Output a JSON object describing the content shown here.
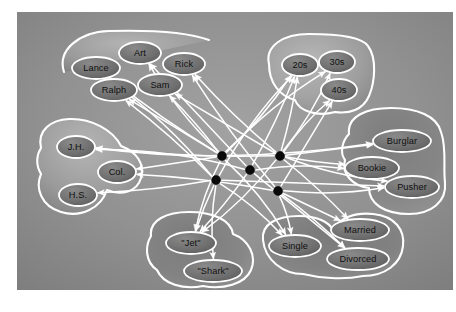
{
  "figure": {
    "type": "network-diagram",
    "background_color": "#8e8e8e",
    "outline_color": "#ffffff",
    "node_fill_color": "#6e6e6e",
    "hidden_unit_color": "#0a0a0a",
    "label_color": "#101010",
    "canvas": {
      "x": 17,
      "y": 12,
      "width": 436,
      "height": 278
    }
  },
  "groups": [
    {
      "id": "names",
      "name": "name-group",
      "nodes": [
        {
          "id": "art",
          "label": "Art",
          "cx": 123,
          "cy": 41,
          "rx": 21,
          "ry": 11
        },
        {
          "id": "lance",
          "label": "Lance",
          "cx": 79,
          "cy": 56,
          "rx": 24,
          "ry": 11
        },
        {
          "id": "rick",
          "label": "Rick",
          "cx": 167,
          "cy": 52,
          "rx": 21,
          "ry": 11
        },
        {
          "id": "sam",
          "label": "Sam",
          "cx": 143,
          "cy": 73,
          "rx": 22,
          "ry": 11
        },
        {
          "id": "ralph",
          "label": "Ralph",
          "cx": 97,
          "cy": 78,
          "rx": 23,
          "ry": 11
        }
      ]
    },
    {
      "id": "age",
      "name": "age-group",
      "nodes": [
        {
          "id": "20s",
          "label": "20s",
          "cx": 283,
          "cy": 53,
          "rx": 18,
          "ry": 11
        },
        {
          "id": "30s",
          "label": "30s",
          "cx": 320,
          "cy": 50,
          "rx": 18,
          "ry": 11
        },
        {
          "id": "40s",
          "label": "40s",
          "cx": 322,
          "cy": 78,
          "rx": 18,
          "ry": 11
        }
      ]
    },
    {
      "id": "education",
      "name": "education-group",
      "nodes": [
        {
          "id": "jh",
          "label": "J.H.",
          "cx": 59,
          "cy": 135,
          "rx": 19,
          "ry": 11
        },
        {
          "id": "col",
          "label": "Col.",
          "cx": 100,
          "cy": 160,
          "rx": 19,
          "ry": 11
        },
        {
          "id": "hs",
          "label": "H.S.",
          "cx": 61,
          "cy": 183,
          "rx": 19,
          "ry": 11
        }
      ]
    },
    {
      "id": "occupation",
      "name": "occupation-group",
      "nodes": [
        {
          "id": "burglar",
          "label": "Burglar",
          "cx": 385,
          "cy": 129,
          "rx": 29,
          "ry": 11
        },
        {
          "id": "bookie",
          "label": "Bookie",
          "cx": 355,
          "cy": 156,
          "rx": 27,
          "ry": 11
        },
        {
          "id": "pusher",
          "label": "Pusher",
          "cx": 395,
          "cy": 175,
          "rx": 27,
          "ry": 11
        }
      ]
    },
    {
      "id": "gang",
      "name": "gang-group",
      "nodes": [
        {
          "id": "jet",
          "label": "\"Jet\"",
          "cx": 174,
          "cy": 231,
          "rx": 25,
          "ry": 11
        },
        {
          "id": "shark",
          "label": "\"Shark\"",
          "cx": 196,
          "cy": 259,
          "rx": 29,
          "ry": 11
        }
      ]
    },
    {
      "id": "marital",
      "name": "marital-status-group",
      "nodes": [
        {
          "id": "single",
          "label": "Single",
          "cx": 278,
          "cy": 234,
          "rx": 26,
          "ry": 11
        },
        {
          "id": "married",
          "label": "Married",
          "cx": 343,
          "cy": 218,
          "rx": 29,
          "ry": 11
        },
        {
          "id": "divorced",
          "label": "Divorced",
          "cx": 341,
          "cy": 247,
          "rx": 31,
          "ry": 11
        }
      ]
    }
  ],
  "hidden_units": [
    {
      "id": "h1",
      "cx": 205,
      "cy": 144,
      "r": 4.4
    },
    {
      "id": "h2",
      "cx": 263,
      "cy": 144,
      "r": 4.4
    },
    {
      "id": "h3",
      "cx": 233,
      "cy": 158,
      "r": 4.4
    },
    {
      "id": "h4",
      "cx": 199,
      "cy": 168,
      "r": 4.4
    },
    {
      "id": "h5",
      "cx": 261,
      "cy": 179,
      "r": 4.4
    }
  ],
  "edges": [
    {
      "from": "h1",
      "to": "art"
    },
    {
      "from": "h1",
      "to": "lance"
    },
    {
      "from": "h1",
      "to": "ralph"
    },
    {
      "from": "h1",
      "to": "sam"
    },
    {
      "from": "h1",
      "to": "20s"
    },
    {
      "from": "h1",
      "to": "30s"
    },
    {
      "from": "h1",
      "to": "jh"
    },
    {
      "from": "h1",
      "to": "col"
    },
    {
      "from": "h1",
      "to": "burglar"
    },
    {
      "from": "h1",
      "to": "jet"
    },
    {
      "from": "h1",
      "to": "single"
    },
    {
      "from": "h2",
      "to": "rick"
    },
    {
      "from": "h2",
      "to": "sam"
    },
    {
      "from": "h2",
      "to": "20s"
    },
    {
      "from": "h2",
      "to": "30s"
    },
    {
      "from": "h2",
      "to": "40s"
    },
    {
      "from": "h2",
      "to": "jh"
    },
    {
      "from": "h2",
      "to": "burglar"
    },
    {
      "from": "h2",
      "to": "bookie"
    },
    {
      "from": "h2",
      "to": "pusher"
    },
    {
      "from": "h2",
      "to": "jet"
    },
    {
      "from": "h2",
      "to": "married"
    },
    {
      "from": "h3",
      "to": "art"
    },
    {
      "from": "h3",
      "to": "20s"
    },
    {
      "from": "h3",
      "to": "jh"
    },
    {
      "from": "h3",
      "to": "bookie"
    },
    {
      "from": "h3",
      "to": "jet"
    },
    {
      "from": "h3",
      "to": "divorced"
    },
    {
      "from": "h4",
      "to": "ralph"
    },
    {
      "from": "h4",
      "to": "lance"
    },
    {
      "from": "h4",
      "to": "20s"
    },
    {
      "from": "h4",
      "to": "hs"
    },
    {
      "from": "h4",
      "to": "pusher"
    },
    {
      "from": "h4",
      "to": "jet"
    },
    {
      "from": "h4",
      "to": "shark"
    },
    {
      "from": "h4",
      "to": "single"
    },
    {
      "from": "h5",
      "to": "rick"
    },
    {
      "from": "h5",
      "to": "40s"
    },
    {
      "from": "h5",
      "to": "col"
    },
    {
      "from": "h5",
      "to": "pusher"
    },
    {
      "from": "h5",
      "to": "single"
    },
    {
      "from": "h5",
      "to": "divorced"
    },
    {
      "from": "h5",
      "to": "married"
    }
  ]
}
